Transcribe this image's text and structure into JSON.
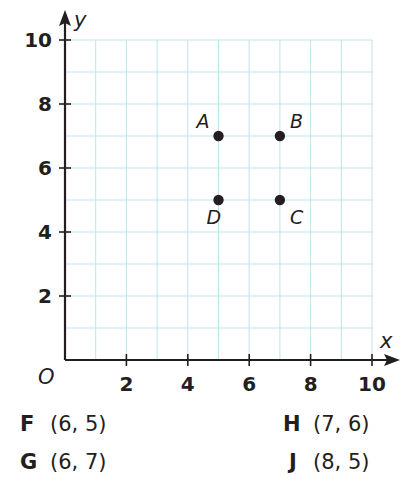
{
  "chart_data": {
    "type": "scatter",
    "title": "",
    "xlabel": "x",
    "ylabel": "y",
    "origin_label": "O",
    "xlim": [
      0,
      10
    ],
    "ylim": [
      0,
      10
    ],
    "grid": true,
    "grid_step": 1,
    "x_ticks": [
      2,
      4,
      6,
      8,
      10
    ],
    "y_ticks": [
      2,
      4,
      6,
      8,
      10
    ],
    "points": [
      {
        "label": "A",
        "x": 5,
        "y": 7,
        "label_pos": "upper-left"
      },
      {
        "label": "B",
        "x": 7,
        "y": 7,
        "label_pos": "upper-right"
      },
      {
        "label": "C",
        "x": 7,
        "y": 5,
        "label_pos": "lower-right"
      },
      {
        "label": "D",
        "x": 5,
        "y": 5,
        "label_pos": "lower-left"
      }
    ],
    "colors": {
      "grid": "#bfe3ef",
      "axis": "#231f20",
      "point": "#231f20"
    }
  },
  "answer_choices": [
    {
      "letter": "F",
      "coord": "(6, 5)"
    },
    {
      "letter": "G",
      "coord": "(6, 7)"
    },
    {
      "letter": "H",
      "coord": "(7, 6)"
    },
    {
      "letter": "J",
      "coord": "(8, 5)"
    }
  ]
}
